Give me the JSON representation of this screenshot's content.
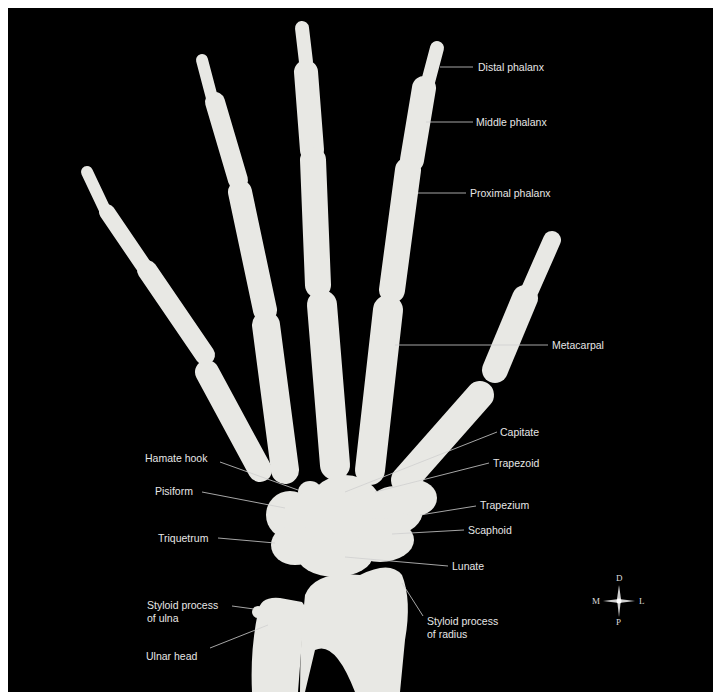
{
  "figure": {
    "background": "#000000",
    "bone_color": "#e8e8e4",
    "line_color": "#d0d0d0",
    "label_color": "#e6e6e6"
  },
  "labels": {
    "distal_phalanx": "Distal phalanx",
    "middle_phalanx": "Middle phalanx",
    "proximal_phalanx": "Proximal phalanx",
    "metacarpal": "Metacarpal",
    "capitate": "Capitate",
    "trapezoid": "Trapezoid",
    "trapezium": "Trapezium",
    "scaphoid": "Scaphoid",
    "lunate": "Lunate",
    "hamate_hook": "Hamate hook",
    "pisiform": "Pisiform",
    "triquetrum": "Triquetrum",
    "styloid_ulna_line1": "Styloid process",
    "styloid_ulna_line2": "of ulna",
    "ulnar_head": "Ulnar head",
    "styloid_radius_line1": "Styloid process",
    "styloid_radius_line2": "of radius"
  },
  "compass": {
    "top": "D",
    "bottom": "P",
    "left": "M",
    "right": "L"
  }
}
